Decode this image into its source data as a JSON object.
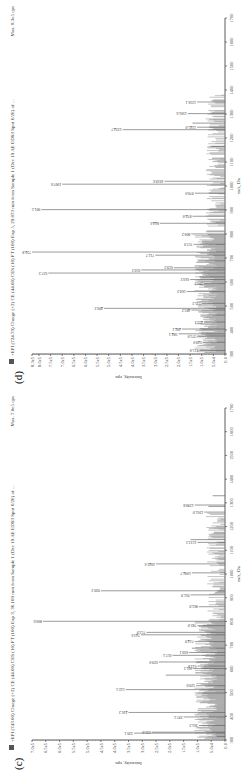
{
  "chart_data": [
    {
      "panel_label": "(c)",
      "type": "bar",
      "title": "+EPI (743.00) Charge (+2) CE (44.00) CES (10) FT (100) Exp 3, 36.109 min from Sample 1 (Dec 19 AE EDS3 Spot 6/26) of ...",
      "max_label": "Max. 7.0e5 cps",
      "xlabel": "m/z, Da",
      "ylabel": "Intensity, cps",
      "xlim": [
        300,
        1700
      ],
      "ylim": [
        0,
        700000
      ],
      "x_ticks": [
        300,
        400,
        500,
        600,
        700,
        800,
        900,
        1000,
        1100,
        1200,
        1300,
        1400,
        1500,
        1600,
        1700
      ],
      "y_ticks": [
        "0.0",
        "5.0e4",
        "1.0e5",
        "1.5e5",
        "2.0e5",
        "2.5e5",
        "3.0e5",
        "3.5e5",
        "4.0e5",
        "4.5e5",
        "5.0e5",
        "5.5e5",
        "6.0e5",
        "6.5e5",
        "7.0e5"
      ],
      "grid": false,
      "peaks": [
        {
          "mz": 315.0,
          "intensity": 30000
        },
        {
          "mz": 329.1,
          "intensity": 330000,
          "label": "329.1"
        },
        {
          "mz": 333.0,
          "intensity": 265000,
          "label": "333.0"
        },
        {
          "mz": 361.2,
          "intensity": 95000,
          "label": "361.2"
        },
        {
          "mz": 397.1,
          "intensity": 150000,
          "label": "397.1"
        },
        {
          "mz": 416.2,
          "intensity": 350000,
          "label": "416.2"
        },
        {
          "mz": 498.1,
          "intensity": 80000
        },
        {
          "mz": 512.5,
          "intensity": 360000,
          "label": "512.5"
        },
        {
          "mz": 529.0,
          "intensity": 105000,
          "label": "529.0"
        },
        {
          "mz": 573.6,
          "intensity": 215000
        },
        {
          "mz": 601.2,
          "intensity": 115000,
          "label": "601.2"
        },
        {
          "mz": 611.8,
          "intensity": 100000,
          "label": "611.8"
        },
        {
          "mz": 629.0,
          "intensity": 240000,
          "label": "629.0"
        },
        {
          "mz": 657.1,
          "intensity": 190000,
          "label": "657.1"
        },
        {
          "mz": 669.1,
          "intensity": 130000,
          "label": "669.1"
        },
        {
          "mz": 687.1,
          "intensity": 120000
        },
        {
          "mz": 714.9,
          "intensity": 110000,
          "label": "714.9"
        },
        {
          "mz": 743.6,
          "intensity": 305000,
          "label": "743.6"
        },
        {
          "mz": 753.9,
          "intensity": 285000,
          "label": "753.9"
        },
        {
          "mz": 782.0,
          "intensity": 100000,
          "label": "782.0"
        },
        {
          "mz": 800.6,
          "intensity": 660000,
          "label": "800.6"
        },
        {
          "mz": 861.9,
          "intensity": 95000,
          "label": "861.9"
        },
        {
          "mz": 911.9,
          "intensity": 125000,
          "label": "911.9"
        },
        {
          "mz": 929.2,
          "intensity": 450000,
          "label": "929.2"
        },
        {
          "mz": 1004.7,
          "intensity": 120000,
          "label": "1004.7"
        },
        {
          "mz": 1042.6,
          "intensity": 250000,
          "label": "1042.6"
        },
        {
          "mz": 1133.3,
          "intensity": 100000,
          "label": "1133.3"
        },
        {
          "mz": 1144.9,
          "intensity": 125000
        },
        {
          "mz": 1261.0,
          "intensity": 75000,
          "label": "1261.0"
        },
        {
          "mz": 1285.0,
          "intensity": 60000
        },
        {
          "mz": 1290.8,
          "intensity": 110000,
          "label": "1290.8"
        },
        {
          "mz": 1330.0,
          "intensity": 45000
        }
      ]
    },
    {
      "panel_label": "(d)",
      "type": "bar",
      "title": "+EPI (724.79) Charge (+2) CE (44.00) CES (10) FT (100) Exp 5, 29.073 min from Sample 1 (Dec 19 AE EDS3 Spot 6/26) of ...",
      "max_label": "Max. 8.3e5 cps",
      "xlabel": "m/z, Da",
      "ylabel": "Intensity, cps",
      "xlim": [
        300,
        1700
      ],
      "ylim": [
        0,
        830000
      ],
      "x_ticks": [
        300,
        400,
        500,
        600,
        700,
        800,
        900,
        1000,
        1100,
        1200,
        1300,
        1400,
        1500,
        1600,
        1700
      ],
      "y_ticks": [
        "0.0",
        "5.0e4",
        "1.0e5",
        "1.5e5",
        "2.0e5",
        "2.5e5",
        "3.0e5",
        "3.5e5",
        "4.0e5",
        "4.5e5",
        "5.0e5",
        "5.5e5",
        "6.0e5",
        "6.5e5",
        "7.0e5",
        "7.5e5",
        "8.0e5",
        "8.3e5"
      ],
      "grid": false,
      "peaks": [
        {
          "mz": 315.0,
          "intensity": 110000,
          "label": "315.0"
        },
        {
          "mz": 349.0,
          "intensity": 95000,
          "label": "349.0"
        },
        {
          "mz": 375.0,
          "intensity": 120000,
          "label": "375.0"
        },
        {
          "mz": 384.1,
          "intensity": 200000,
          "label": "384.1"
        },
        {
          "mz": 404.1,
          "intensity": 185000,
          "label": "404.1"
        },
        {
          "mz": 433.1,
          "intensity": 90000,
          "label": "433.1"
        },
        {
          "mz": 462.1,
          "intensity": 105000
        },
        {
          "mz": 483.2,
          "intensity": 145000,
          "label": "483.2"
        },
        {
          "mz": 490.2,
          "intensity": 520000,
          "label": "490.2"
        },
        {
          "mz": 511.2,
          "intensity": 100000,
          "label": "511.2"
        },
        {
          "mz": 560.2,
          "intensity": 165000,
          "label": "560.2"
        },
        {
          "mz": 593.2,
          "intensity": 90000,
          "label": "593.2"
        },
        {
          "mz": 610.2,
          "intensity": 150000,
          "label": "610.2"
        },
        {
          "mz": 621.3,
          "intensity": 110000
        },
        {
          "mz": 637.3,
          "intensity": 760000,
          "label": "637.3"
        },
        {
          "mz": 650.2,
          "intensity": 360000,
          "label": "650.2"
        },
        {
          "mz": 659.2,
          "intensity": 220000,
          "label": "659.2"
        },
        {
          "mz": 688.2,
          "intensity": 115000
        },
        {
          "mz": 711.7,
          "intensity": 300000,
          "label": "711.7"
        },
        {
          "mz": 724.8,
          "intensity": 830000,
          "label": "724.8"
        },
        {
          "mz": 757.0,
          "intensity": 135000,
          "label": "757.0"
        },
        {
          "mz": 800.2,
          "intensity": 145000,
          "label": "800.2"
        },
        {
          "mz": 844.6,
          "intensity": 280000,
          "label": "844.6"
        },
        {
          "mz": 874.0,
          "intensity": 140000,
          "label": "874.0"
        },
        {
          "mz": 901.5,
          "intensity": 790000,
          "label": "901.5"
        },
        {
          "mz": 970.0,
          "intensity": 130000,
          "label": "970.0"
        },
        {
          "mz": 1007.6,
          "intensity": 700000,
          "label": "1007.6"
        },
        {
          "mz": 1019.6,
          "intensity": 260000,
          "label": "1019.6"
        },
        {
          "mz": 1165.0,
          "intensity": 60000
        },
        {
          "mz": 1234.7,
          "intensity": 440000,
          "label": "1234.7"
        },
        {
          "mz": 1245.0,
          "intensity": 120000,
          "label": "1245.0"
        },
        {
          "mz": 1262.0,
          "intensity": 140000
        },
        {
          "mz": 1301.6,
          "intensity": 160000,
          "label": "1301.6"
        },
        {
          "mz": 1350.1,
          "intensity": 120000,
          "label": "1350.1"
        }
      ]
    }
  ]
}
